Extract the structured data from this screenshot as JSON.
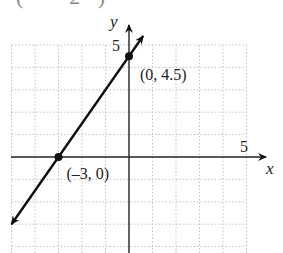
{
  "header_fragment": "(   – 2 )",
  "chart_data": {
    "type": "line",
    "title": "",
    "xlabel": "x",
    "ylabel": "y",
    "xlim": [
      -5,
      5
    ],
    "ylim": [
      -4,
      5
    ],
    "grid": true,
    "x_tick_labels": [
      {
        "value": 5,
        "label": "5"
      }
    ],
    "y_tick_labels": [
      {
        "value": 5,
        "label": "5"
      }
    ],
    "series": [
      {
        "name": "line",
        "equation": "y = 1.5x + 4.5",
        "x": [
          -5,
          -3,
          0,
          0.6
        ],
        "y": [
          -3,
          0,
          4.5,
          5.4
        ],
        "arrows": "both"
      }
    ],
    "points": [
      {
        "x": 0,
        "y": 4.5,
        "label": "(0, 4.5)"
      },
      {
        "x": -3,
        "y": 0,
        "label": "(–3, 0)"
      }
    ],
    "colors": {
      "line": "#111111",
      "grid": "#bbbbbb",
      "axis": "#222222"
    }
  }
}
